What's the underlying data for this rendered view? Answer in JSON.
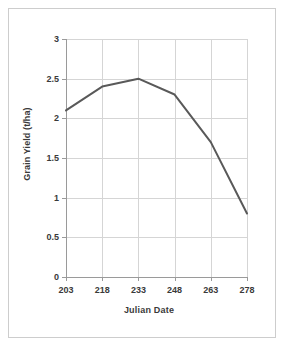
{
  "chart_data": {
    "type": "line",
    "title": "",
    "xlabel": "Julian Date",
    "ylabel": "Grain Yield (t/ha)",
    "categories": [
      "203",
      "218",
      "233",
      "248",
      "263",
      "278"
    ],
    "x": [
      203,
      218,
      233,
      248,
      263,
      278
    ],
    "values": [
      2.1,
      2.4,
      2.5,
      2.3,
      1.7,
      0.8
    ],
    "series": [
      {
        "name": "Grain Yield",
        "values": [
          2.1,
          2.4,
          2.5,
          2.3,
          1.7,
          0.8
        ],
        "color": "#595959"
      }
    ],
    "ylim": [
      0,
      3
    ],
    "ytick_labels": [
      "0",
      "0.5",
      "1",
      "1.5",
      "2",
      "2.5",
      "3"
    ],
    "ytick_values": [
      0,
      0.5,
      1,
      1.5,
      2,
      2.5,
      3
    ],
    "xtick_labels": [
      "203",
      "218",
      "233",
      "248",
      "263",
      "278"
    ],
    "grid": true,
    "grid_color": "#d5d5d5",
    "legend": false,
    "legend_position": "none",
    "markers": false,
    "line_color": "#595959",
    "axis_color": "#9a9a9a",
    "background": "#ffffff",
    "frame_color": "#cdcdcd"
  }
}
